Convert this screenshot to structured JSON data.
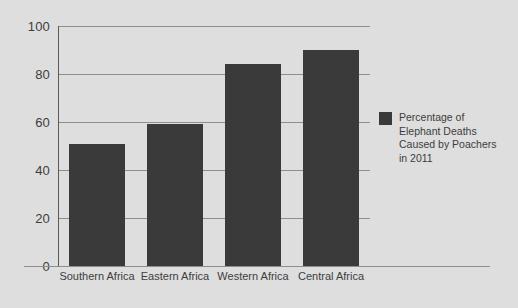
{
  "chart_data": {
    "type": "bar",
    "title": "",
    "xlabel": "",
    "ylabel": "",
    "categories": [
      "Southern Africa",
      "Eastern Africa",
      "Western Africa",
      "Central Africa"
    ],
    "values": [
      51,
      59,
      84,
      90
    ],
    "ylim": [
      0,
      100
    ],
    "yticks": [
      0,
      20,
      40,
      60,
      80,
      100
    ],
    "ytick_labels": [
      "0",
      "20",
      "40",
      "60",
      "80",
      "100"
    ],
    "grid": true,
    "legend_position": "right",
    "series": [
      {
        "name": "Percentage of Elephant Deaths Caused by Poachers in 2011",
        "values": [
          51,
          59,
          84,
          90
        ],
        "color": "#3a3a3a"
      }
    ],
    "legend": [
      {
        "label": "Percentage of\nElephant Deaths\nCaused by Poachers\nin 2011",
        "color": "#3a3a3a"
      }
    ]
  },
  "colors": {
    "background": "#dedede",
    "bar": "#3a3a3a",
    "gridline": "#8e8e8e",
    "axis": "#5a5a5a",
    "text": "#3d3d3d"
  }
}
